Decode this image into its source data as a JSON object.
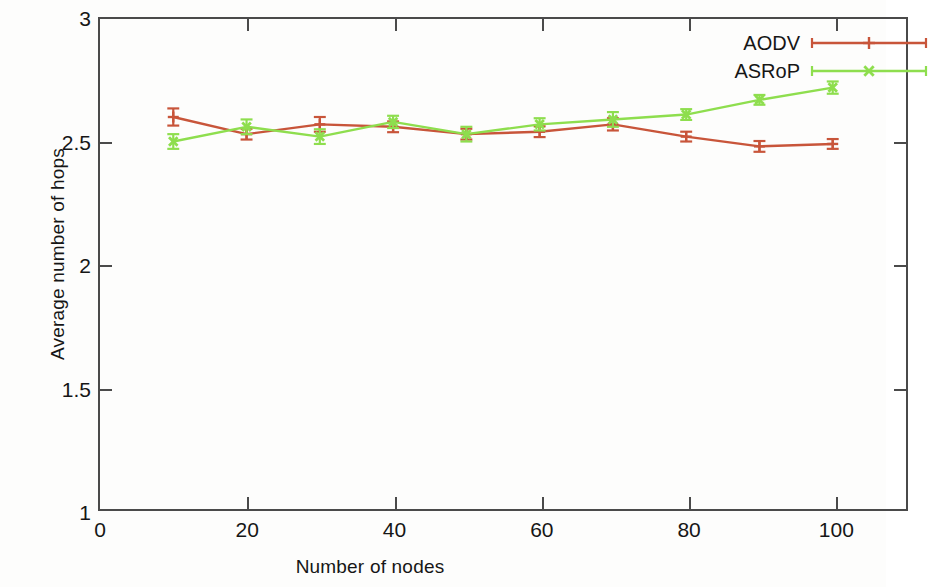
{
  "chart_data": {
    "type": "line",
    "title": "",
    "xlabel": "Number of nodes",
    "ylabel": "Average number of hops",
    "xlim": [
      0,
      110
    ],
    "ylim": [
      1,
      3
    ],
    "xticks": [
      0,
      20,
      40,
      60,
      80,
      100
    ],
    "yticks": [
      1,
      1.5,
      2,
      2.5,
      3
    ],
    "xtick_labels": [
      "0",
      "20",
      "40",
      "60",
      "80",
      "100"
    ],
    "ytick_labels": [
      "1",
      "1.5",
      "2",
      "2.5",
      "3"
    ],
    "grid": false,
    "legend_position": "top-right",
    "x": [
      10,
      20,
      30,
      40,
      50,
      60,
      70,
      80,
      90,
      100
    ],
    "series": [
      {
        "name": "AODV",
        "color": "#c8553a",
        "marker": "plus",
        "values": [
          2.6,
          2.53,
          2.57,
          2.56,
          2.53,
          2.54,
          2.57,
          2.52,
          2.48,
          2.49
        ],
        "errors": [
          0.035,
          0.022,
          0.03,
          0.022,
          0.022,
          0.022,
          0.025,
          0.02,
          0.022,
          0.02
        ]
      },
      {
        "name": "ASRoP",
        "color": "#8ede4e",
        "marker": "cross",
        "values": [
          2.5,
          2.56,
          2.52,
          2.58,
          2.53,
          2.57,
          2.59,
          2.61,
          2.67,
          2.72
        ],
        "errors": [
          0.03,
          0.03,
          0.03,
          0.025,
          0.03,
          0.025,
          0.03,
          0.022,
          0.02,
          0.025
        ]
      }
    ]
  },
  "legend": {
    "items": [
      {
        "label": "AODV"
      },
      {
        "label": "ASRoP"
      }
    ]
  }
}
